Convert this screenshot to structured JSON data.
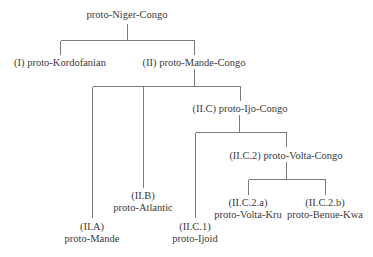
{
  "diagram": {
    "type": "family-tree",
    "colors": {
      "line": "#7a7a7a",
      "text": "#3a3a3a",
      "background": "#ffffff"
    },
    "nodes": {
      "root": {
        "label": "proto-Niger-Congo"
      },
      "kordofanian": {
        "label": "(I) proto-Kordofanian"
      },
      "mande_congo": {
        "label": "(II) proto-Mande-Congo"
      },
      "mande": {
        "code": "(II.A)",
        "name": "proto-Mande"
      },
      "atlantic": {
        "code": "(II.B)",
        "name": "proto-Atlantic"
      },
      "ijo_congo": {
        "label": "(II.C) proto-Ijo-Congo"
      },
      "ijoid": {
        "code": "(II.C.1)",
        "name": "proto-Ijoid"
      },
      "volta_congo": {
        "label": "(II.C.2) proto-Volta-Congo"
      },
      "volta_kru": {
        "code": "(II.C.2.a)",
        "name": "proto-Volta-Kru"
      },
      "benue_kwa": {
        "code": "(II.C.2.b)",
        "name": "proto-Benue-Kwa"
      }
    },
    "edges": [
      [
        "root",
        "kordofanian"
      ],
      [
        "root",
        "mande_congo"
      ],
      [
        "mande_congo",
        "mande"
      ],
      [
        "mande_congo",
        "atlantic"
      ],
      [
        "mande_congo",
        "ijo_congo"
      ],
      [
        "ijo_congo",
        "ijoid"
      ],
      [
        "ijo_congo",
        "volta_congo"
      ],
      [
        "volta_congo",
        "volta_kru"
      ],
      [
        "volta_congo",
        "benue_kwa"
      ]
    ]
  }
}
